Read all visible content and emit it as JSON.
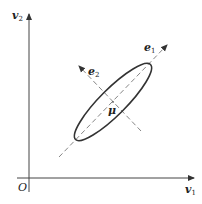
{
  "diagram": {
    "title": "",
    "axes": {
      "x_label": "v",
      "x_sub": "1",
      "y_label": "v",
      "y_sub": "2",
      "origin_label": "O"
    },
    "vectors": [
      {
        "label": "e",
        "sub": "1"
      },
      {
        "label": "e",
        "sub": "2"
      }
    ],
    "center_label": "μ",
    "colors": {
      "line": "#333333",
      "dashed": "#777777"
    }
  }
}
